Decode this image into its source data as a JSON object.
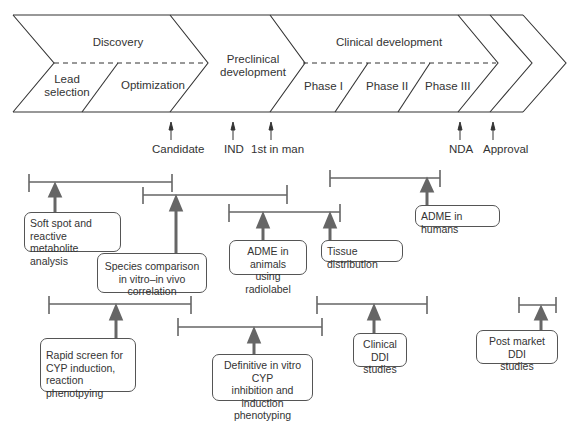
{
  "pipeline": {
    "stages": [
      {
        "label": "Discovery",
        "substages": [
          "Lead selection",
          "Optimization"
        ]
      },
      {
        "label": "Preclinical development",
        "substages": []
      },
      {
        "label": "Clinical development",
        "substages": [
          "Phase I",
          "Phase II",
          "Phase III"
        ]
      }
    ],
    "discovery": "Discovery",
    "lead_selection_line1": "Lead",
    "lead_selection_line2": "selection",
    "optimization": "Optimization",
    "preclinical_line1": "Preclinical",
    "preclinical_line2": "development",
    "clinical": "Clinical development",
    "phase1": "Phase I",
    "phase2": "Phase II",
    "phase3": "Phase III"
  },
  "milestones": {
    "candidate": "Candidate",
    "ind": "IND",
    "first_in_man": "1st in man",
    "nda": "NDA",
    "approval": "Approval"
  },
  "activities": {
    "soft_spot": "Soft spot and reactive metabolite analysis",
    "species_line1": "Species comparison",
    "species_line2": "in vitro–in vivo correlation",
    "adme_animals_line1": "ADME in animals",
    "adme_animals_line2": "using radiolabel",
    "tissue": "Tissue distribution",
    "adme_humans": "ADME in humans",
    "rapid_screen": "Rapid screen for CYP induction, reaction phenotpying",
    "definitive_line1": "Definitive in vitro CYP",
    "definitive_line2": "inhibition and induction",
    "definitive_line3": "phenotyping",
    "clinical_ddi_line1": "Clinical DDI",
    "clinical_ddi_line2": "studies",
    "post_market_line1": "Post market DDI",
    "post_market_line2": "studies"
  },
  "colors": {
    "outline": "#333333",
    "bracket": "#666666",
    "background": "#ffffff"
  }
}
